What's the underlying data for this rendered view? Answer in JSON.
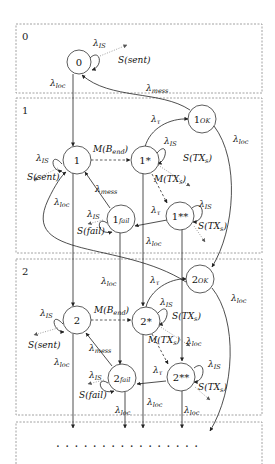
{
  "diagram": {
    "type": "markov-chain-state-diagram",
    "levels": [
      {
        "id": "level-0",
        "label": "0"
      },
      {
        "id": "level-1",
        "label": "1"
      },
      {
        "id": "level-2",
        "label": "2"
      },
      {
        "id": "level-3",
        "label": ""
      }
    ],
    "nodes": {
      "n0": {
        "main": "0",
        "sub": ""
      },
      "n1": {
        "main": "1",
        "sub": ""
      },
      "n1ok": {
        "main": "1",
        "sub": "OK"
      },
      "n1s": {
        "main": "1*",
        "sub": ""
      },
      "n1ss": {
        "main": "1**",
        "sub": ""
      },
      "n1fail": {
        "main": "1",
        "sub": "fail"
      },
      "n2": {
        "main": "2",
        "sub": ""
      },
      "n2ok": {
        "main": "2",
        "sub": "OK"
      },
      "n2s": {
        "main": "2*",
        "sub": ""
      },
      "n2ss": {
        "main": "2**",
        "sub": ""
      },
      "n2fail": {
        "main": "2",
        "sub": "fail"
      }
    },
    "labels": {
      "lambda": "λ",
      "is": "IS",
      "loc": "loc",
      "mess": "mess",
      "tau": "τ",
      "s_sent": "S(sent)",
      "s_fail": "S(fail)",
      "s_txs_main": "S(TX",
      "s_txs_sub": "s",
      "close": ")",
      "m_bend_main": "M(B",
      "m_bend_sub": "end",
      "m_txs_main": "M(TX"
    },
    "continuation": "................"
  }
}
